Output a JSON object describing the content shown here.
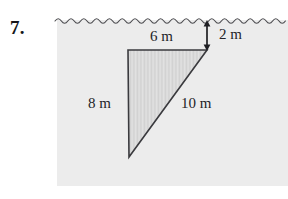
{
  "problem": {
    "number": "7.",
    "figure_name": "right-triangle-submerged-below-water-surface"
  },
  "figure": {
    "water_line": {
      "name": "wavy-water-surface-line",
      "style": "scalloped-wave",
      "color": "#4a4a4e"
    },
    "panel": {
      "background_color": "#ececec"
    },
    "triangle": {
      "name": "right-triangle",
      "fill_color": "#e0e0e0",
      "hatch_color": "#c9c9c9",
      "stroke_color": "#3a3a3e",
      "vertices": [
        {
          "name": "top-left-right-angle",
          "x": 128,
          "y": 50
        },
        {
          "name": "top-right",
          "x": 207,
          "y": 50
        },
        {
          "name": "bottom-left",
          "x": 129,
          "y": 157
        }
      ]
    },
    "depth_arrow": {
      "name": "double-headed-depth-arrow",
      "color": "#1f1f23",
      "from_y": 21,
      "to_y": 50,
      "x": 207
    }
  },
  "labels": {
    "top_side": "6 m",
    "left_side": "8 m",
    "hypotenuse": "10 m",
    "depth": "2 m"
  }
}
